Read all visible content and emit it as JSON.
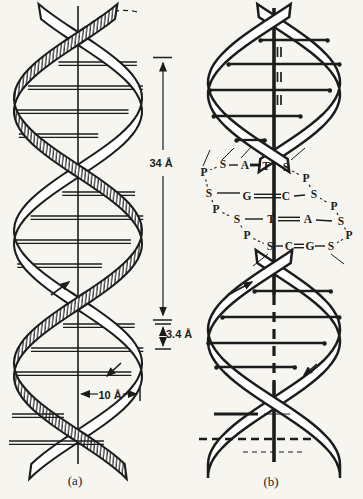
{
  "figure": {
    "background": "#f6f5f0",
    "ink": "#1c1c1c",
    "panel_a_label": "(a)",
    "panel_b_label": "(b)"
  },
  "dimensions": {
    "helix_turn": "34 Å",
    "base_spacing": "3.4 Å",
    "radius": "10 Å"
  },
  "ladder": {
    "pairs_order": [
      "A=T",
      "G=C",
      "T=A",
      "C=G"
    ],
    "letters": [
      {
        "t": "P",
        "x": 204,
        "y": 176
      },
      {
        "t": "S",
        "x": 223,
        "y": 168
      },
      {
        "t": "A",
        "x": 245,
        "y": 169
      },
      {
        "t": "T",
        "x": 266,
        "y": 170
      },
      {
        "t": "S",
        "x": 286,
        "y": 171
      },
      {
        "t": "P",
        "x": 306,
        "y": 182
      },
      {
        "t": "S",
        "x": 209,
        "y": 197
      },
      {
        "t": "G",
        "x": 247,
        "y": 200
      },
      {
        "t": "C",
        "x": 286,
        "y": 200
      },
      {
        "t": "S",
        "x": 314,
        "y": 198
      },
      {
        "t": "P",
        "x": 216,
        "y": 213
      },
      {
        "t": "P",
        "x": 334,
        "y": 210
      },
      {
        "t": "S",
        "x": 237,
        "y": 223
      },
      {
        "t": "T",
        "x": 271,
        "y": 223
      },
      {
        "t": "A",
        "x": 308,
        "y": 223
      },
      {
        "t": "S",
        "x": 341,
        "y": 225
      },
      {
        "t": "P",
        "x": 247,
        "y": 239
      },
      {
        "t": "P",
        "x": 349,
        "y": 239
      },
      {
        "t": "S",
        "x": 270,
        "y": 250
      },
      {
        "t": "C",
        "x": 289,
        "y": 250
      },
      {
        "t": "G",
        "x": 310,
        "y": 250
      },
      {
        "t": "S",
        "x": 331,
        "y": 250
      }
    ],
    "left_chain": [
      1,
      0,
      6,
      10,
      12,
      16,
      18
    ],
    "right_chain": [
      4,
      5,
      9,
      11,
      15,
      17,
      21
    ],
    "pair_bonds": [
      {
        "x1": 229,
        "y1": 165,
        "x2": 238,
        "y2": 165,
        "style": "solid"
      },
      {
        "x1": 250,
        "y1": 165,
        "x2": 261,
        "y2": 165,
        "style": "thick"
      },
      {
        "x1": 217,
        "y1": 193,
        "x2": 240,
        "y2": 193,
        "style": "solid"
      },
      {
        "x1": 254,
        "y1": 196,
        "x2": 281,
        "y2": 196,
        "style": "double"
      },
      {
        "x1": 294,
        "y1": 196,
        "x2": 305,
        "y2": 195,
        "style": "solid"
      },
      {
        "x1": 245,
        "y1": 219,
        "x2": 263,
        "y2": 219,
        "style": "solid"
      },
      {
        "x1": 278,
        "y1": 219,
        "x2": 300,
        "y2": 219,
        "style": "double"
      },
      {
        "x1": 316,
        "y1": 220,
        "x2": 332,
        "y2": 221,
        "style": "solid"
      },
      {
        "x1": 276,
        "y1": 246,
        "x2": 283,
        "y2": 246,
        "style": "solid"
      },
      {
        "x1": 294,
        "y1": 246,
        "x2": 304,
        "y2": 246,
        "style": "double"
      },
      {
        "x1": 315,
        "y1": 246,
        "x2": 325,
        "y2": 246,
        "style": "solid"
      }
    ],
    "connector_lines": [
      {
        "x1": 210,
        "y1": 150,
        "x2": 203,
        "y2": 166
      },
      {
        "x1": 234,
        "y1": 148,
        "x2": 222,
        "y2": 160
      },
      {
        "x1": 252,
        "y1": 146,
        "x2": 241,
        "y2": 158
      },
      {
        "x1": 305,
        "y1": 148,
        "x2": 291,
        "y2": 160
      },
      {
        "x1": 268,
        "y1": 254,
        "x2": 253,
        "y2": 266
      },
      {
        "x1": 331,
        "y1": 254,
        "x2": 344,
        "y2": 264
      }
    ]
  },
  "helix_a": {
    "axis_x": 78,
    "amplitude": 64,
    "ribbon_width": 13,
    "y_top": 4,
    "y_bottom": 466,
    "first_crossing_y": 32,
    "half_period": 132.5,
    "rung_skew": 26,
    "rungs": [
      62,
      86,
      110,
      134,
      192,
      216,
      240,
      264,
      324,
      348,
      372
    ],
    "extra_segments": [
      {
        "x1": 12,
        "y1": 414,
        "x2": 64,
        "y2": 414,
        "style": "rungpair"
      },
      {
        "x1": 9,
        "y1": 441,
        "x2": 104,
        "y2": 441,
        "style": "rungpair"
      }
    ]
  },
  "helix_b": {
    "axis_x": 274,
    "amplitude": 66,
    "ribbon_width": 12,
    "rung_skew": 24,
    "segments": [
      {
        "y_top": 4,
        "y_bottom": 160,
        "crossing_y": 15,
        "half_period": 135,
        "rungs": [
          40,
          64,
          90,
          116,
          140
        ]
      },
      {
        "y_top": 250,
        "y_bottom": 466,
        "crossing_y": 262,
        "half_period": 135,
        "rungs": [
          291,
          317,
          343,
          367
        ]
      }
    ],
    "hbond_ticks": [
      52,
      77,
      100
    ],
    "extra_segments": [
      {
        "x1": 214,
        "y1": 414,
        "x2": 258,
        "y2": 414,
        "style": "thick"
      },
      {
        "x1": 264,
        "y1": 414,
        "x2": 290,
        "y2": 414,
        "style": "thin"
      },
      {
        "x1": 199,
        "y1": 439,
        "x2": 312,
        "y2": 439,
        "style": "thickdash"
      },
      {
        "x1": 243,
        "y1": 452,
        "x2": 302,
        "y2": 452,
        "style": "thindash"
      }
    ]
  }
}
